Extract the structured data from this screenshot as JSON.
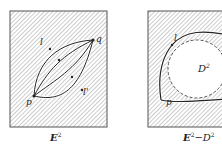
{
  "panels": [
    {
      "id": "left",
      "caption": {
        "main": "E",
        "sup": "2",
        "rest": "",
        "rest_sup": ""
      },
      "labels": {
        "p": "p",
        "q": "q",
        "l": "l",
        "l_prime": "l'"
      }
    },
    {
      "id": "right",
      "caption": {
        "main": "E",
        "sup": "2",
        "rest": "−D",
        "rest_sup": "2"
      },
      "labels": {
        "p": "p",
        "l": "l",
        "disk": "D",
        "disk_sup": "2"
      }
    }
  ],
  "colors": {
    "hatch": "#8a8a8a",
    "frame": "#555555",
    "curve": "#222222",
    "background": "#ffffff"
  }
}
